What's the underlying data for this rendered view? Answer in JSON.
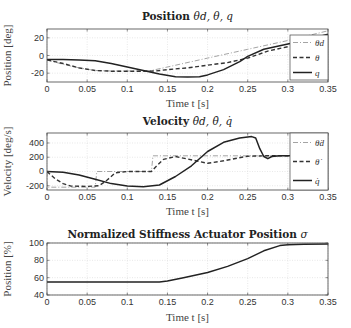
{
  "chart_data": [
    {
      "type": "line",
      "title": "Position θ_d, θ, q",
      "title_text": "Position ",
      "title_math": "θd, θ, q",
      "xlabel": "Time t [s]",
      "ylabel": "Position [deg]",
      "xlim": [
        0,
        0.35
      ],
      "ylim": [
        -30,
        30
      ],
      "xticks": [
        0,
        0.05,
        0.1,
        0.15,
        0.2,
        0.25,
        0.3,
        0.35
      ],
      "xtick_labels": [
        "0",
        "0.05",
        "0.1",
        "0.15",
        "0.2",
        "0.25",
        "0.3",
        "0.35"
      ],
      "yticks": [
        -20,
        0,
        20
      ],
      "ytick_labels": [
        "-20",
        "0",
        "20"
      ],
      "grid": true,
      "legend_position": "right inside",
      "series": [
        {
          "name": "θ_d",
          "style": "dashdot",
          "color": "#9a9a9a",
          "x": [
            0,
            0.02,
            0.04,
            0.06,
            0.08,
            0.1,
            0.12,
            0.13,
            0.15,
            0.2,
            0.25,
            0.3,
            0.35
          ],
          "y": [
            -5,
            -10,
            -14,
            -17,
            -17.5,
            -17.5,
            -17.5,
            -17,
            -13,
            -3,
            7,
            17,
            28
          ]
        },
        {
          "name": "θ",
          "style": "dashed",
          "color": "#333333",
          "x": [
            0,
            0.02,
            0.04,
            0.06,
            0.08,
            0.1,
            0.12,
            0.135,
            0.15,
            0.175,
            0.2,
            0.225,
            0.25,
            0.275,
            0.3,
            0.325,
            0.35
          ],
          "y": [
            -5,
            -9,
            -14,
            -17,
            -17.8,
            -17.8,
            -17.8,
            -17.5,
            -16,
            -14,
            -11,
            -8,
            -3,
            5,
            10,
            14,
            23
          ]
        },
        {
          "name": "q",
          "style": "solid",
          "color": "#222222",
          "x": [
            0,
            0.02,
            0.04,
            0.06,
            0.08,
            0.1,
            0.12,
            0.14,
            0.16,
            0.175,
            0.19,
            0.2,
            0.22,
            0.24,
            0.25,
            0.27,
            0.29,
            0.3,
            0.32,
            0.35
          ],
          "y": [
            -4.5,
            -4.5,
            -5,
            -6,
            -9,
            -13,
            -17,
            -21,
            -24,
            -24.5,
            -24,
            -22,
            -16,
            -7,
            -1,
            7,
            11,
            13,
            17,
            24
          ]
        }
      ]
    },
    {
      "type": "line",
      "title": "Velocity θ̇_d, θ̇, q̇",
      "title_text": "Velocity ",
      "title_math": "θ̇d, θ̇, q̇",
      "xlabel": "Time t [s]",
      "ylabel": "Velocity [deg/s]",
      "xlim": [
        0,
        0.35
      ],
      "ylim": [
        -260,
        540
      ],
      "xticks": [
        0,
        0.05,
        0.1,
        0.15,
        0.2,
        0.25,
        0.3,
        0.35
      ],
      "xtick_labels": [
        "0",
        "0.05",
        "0.1",
        "0.15",
        "0.2",
        "0.25",
        "0.3",
        "0.35"
      ],
      "yticks": [
        -200,
        0,
        200,
        400
      ],
      "ytick_labels": [
        "-200",
        "0",
        "200",
        "400"
      ],
      "grid": true,
      "legend_position": "right inside",
      "series": [
        {
          "name": "θ̇_d",
          "style": "dashdot",
          "color": "#9a9a9a",
          "x": [
            0,
            0.0,
            0.06,
            0.062,
            0.13,
            0.132,
            0.35
          ],
          "y": [
            0,
            -220,
            -220,
            0,
            0,
            220,
            220
          ]
        },
        {
          "name": "θ̇",
          "style": "dashed",
          "color": "#333333",
          "x": [
            0,
            0.01,
            0.02,
            0.03,
            0.05,
            0.065,
            0.075,
            0.085,
            0.1,
            0.13,
            0.135,
            0.145,
            0.16,
            0.175,
            0.2,
            0.22,
            0.25,
            0.27,
            0.3,
            0.35
          ],
          "y": [
            0,
            -100,
            -170,
            -205,
            -210,
            -200,
            -120,
            -20,
            0,
            0,
            60,
            170,
            210,
            175,
            115,
            150,
            215,
            220,
            220,
            220
          ]
        },
        {
          "name": "q̇",
          "style": "solid",
          "color": "#222222",
          "x": [
            0,
            0.02,
            0.04,
            0.06,
            0.08,
            0.1,
            0.12,
            0.14,
            0.16,
            0.18,
            0.2,
            0.22,
            0.24,
            0.255,
            0.26,
            0.265,
            0.27,
            0.275,
            0.28,
            0.29,
            0.3,
            0.35
          ],
          "y": [
            0,
            -10,
            -50,
            -110,
            -170,
            -205,
            -215,
            -190,
            -70,
            80,
            280,
            410,
            470,
            490,
            470,
            320,
            210,
            180,
            210,
            220,
            220,
            220
          ]
        }
      ]
    },
    {
      "type": "line",
      "title": "Normalized Stiffness Actuator Position σ",
      "title_text": "Normalized Stiffness Actuator Position ",
      "title_math": "σ",
      "xlabel": "Time t [s]",
      "ylabel": "Position [%]",
      "xlim": [
        0,
        0.35
      ],
      "ylim": [
        40,
        100
      ],
      "xticks": [
        0,
        0.05,
        0.1,
        0.15,
        0.2,
        0.25,
        0.3,
        0.35
      ],
      "xtick_labels": [
        "0",
        "0.05",
        "0.1",
        "0.15",
        "0.2",
        "0.25",
        "0.3",
        "0.35"
      ],
      "yticks": [
        40,
        60,
        80,
        100
      ],
      "ytick_labels": [
        "40",
        "60",
        "80",
        "100"
      ],
      "grid": true,
      "series": [
        {
          "name": "σ",
          "style": "solid",
          "color": "#222222",
          "x": [
            0,
            0.05,
            0.1,
            0.14,
            0.15,
            0.17,
            0.2,
            0.225,
            0.25,
            0.27,
            0.29,
            0.3,
            0.32,
            0.35
          ],
          "y": [
            55,
            55,
            55,
            55,
            56,
            60,
            66,
            73,
            82,
            91,
            97,
            98,
            98.5,
            99
          ]
        }
      ]
    }
  ]
}
